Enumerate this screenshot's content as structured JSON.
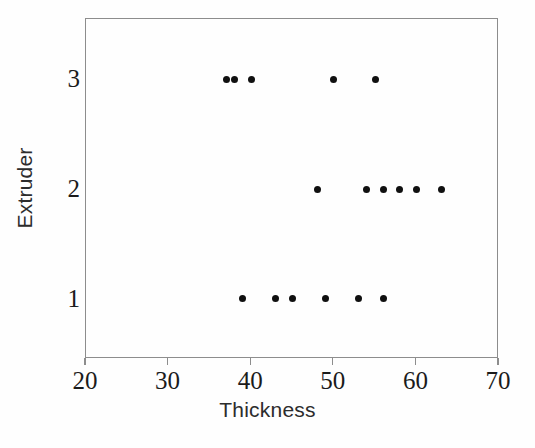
{
  "figure": {
    "background_color": "#fefefe",
    "frame_color": "#8d8d8d",
    "point_color": "#101010"
  },
  "chart_data": {
    "type": "scatter",
    "title": "",
    "xlabel": "Thickness",
    "ylabel": "Extruder",
    "xlim": [
      20,
      70
    ],
    "ylim": [
      0.45,
      3.55
    ],
    "xticks": [
      20,
      30,
      40,
      50,
      60,
      70
    ],
    "xticklabels": [
      "20",
      "30",
      "40",
      "50",
      "60",
      "70"
    ],
    "yticks": [
      1,
      2,
      3
    ],
    "yticklabels": [
      "1",
      "2",
      "3"
    ],
    "grid": false,
    "legend": null,
    "marker": "filled-circle",
    "marker_size_px": 7,
    "series": [
      {
        "name": "Extruder 1",
        "y": 1,
        "values": [
          39,
          43,
          45,
          49,
          53,
          56
        ]
      },
      {
        "name": "Extruder 2",
        "y": 2,
        "values": [
          48,
          54,
          56,
          58,
          60,
          63
        ]
      },
      {
        "name": "Extruder 3",
        "y": 3,
        "values": [
          37,
          38,
          40,
          50,
          55
        ]
      }
    ],
    "points": [
      {
        "x": 39,
        "y": 1
      },
      {
        "x": 43,
        "y": 1
      },
      {
        "x": 45,
        "y": 1
      },
      {
        "x": 49,
        "y": 1
      },
      {
        "x": 53,
        "y": 1
      },
      {
        "x": 56,
        "y": 1
      },
      {
        "x": 48,
        "y": 2
      },
      {
        "x": 54,
        "y": 2
      },
      {
        "x": 56,
        "y": 2
      },
      {
        "x": 58,
        "y": 2
      },
      {
        "x": 60,
        "y": 2
      },
      {
        "x": 63,
        "y": 2
      },
      {
        "x": 37,
        "y": 3
      },
      {
        "x": 38,
        "y": 3
      },
      {
        "x": 40,
        "y": 3
      },
      {
        "x": 50,
        "y": 3
      },
      {
        "x": 55,
        "y": 3
      }
    ]
  }
}
